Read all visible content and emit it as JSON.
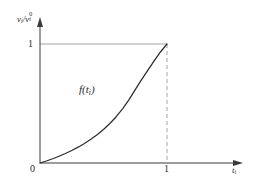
{
  "figure": {
    "background_color": "#ffffff",
    "curve_color": "#2b2b2b",
    "axis_color": "#3a3a3a",
    "guide_color": "#9a9a9a",
    "dashed_color": "#9a9a9a"
  },
  "labels": {
    "y_axis_numerator_var": "v",
    "y_axis_numerator_sub": "i",
    "y_axis_divider": "/",
    "y_axis_denominator_var": "v",
    "y_axis_denominator_sup": "0",
    "y_axis_denominator_sub": "i",
    "x_axis_var": "t",
    "x_axis_sub": "i",
    "function_name": "f",
    "function_open": "(",
    "function_arg_var": "t",
    "function_arg_sub": "i",
    "function_close": ")",
    "y_tick_one": "1",
    "x_tick_one": "1",
    "origin": "0"
  },
  "chart_data": {
    "type": "line",
    "title": "",
    "xlabel": "t_i",
    "ylabel": "v_i / v_i^0",
    "xlim": [
      0,
      1
    ],
    "ylim": [
      0,
      1
    ],
    "grid": false,
    "legend_position": "none",
    "x_ticks": [
      0,
      1
    ],
    "x_tick_labels": [
      "0",
      "1"
    ],
    "y_ticks": [
      0,
      1
    ],
    "y_tick_labels": [
      "0",
      "1"
    ],
    "annotations": [
      {
        "text": "f(t_i)",
        "x": 0.33,
        "y": 0.62
      }
    ],
    "reference_lines": [
      {
        "orientation": "horizontal",
        "value": 1,
        "style": "solid",
        "color": "#9a9a9a",
        "from": 0,
        "to": 1
      },
      {
        "orientation": "vertical",
        "value": 1,
        "style": "dashed",
        "color": "#9a9a9a",
        "from": 0,
        "to": 1
      }
    ],
    "series": [
      {
        "name": "f(t_i)",
        "description": "convex monotonically increasing curve from (0,0) to (1,1)",
        "x": [
          0.0,
          0.05,
          0.1,
          0.15,
          0.2,
          0.25,
          0.3,
          0.35,
          0.4,
          0.45,
          0.5,
          0.55,
          0.6,
          0.65,
          0.7,
          0.75,
          0.8,
          0.85,
          0.9,
          0.95,
          1.0
        ],
        "y": [
          0.0,
          0.017,
          0.036,
          0.057,
          0.08,
          0.105,
          0.133,
          0.164,
          0.199,
          0.238,
          0.282,
          0.332,
          0.389,
          0.455,
          0.53,
          0.616,
          0.7,
          0.78,
          0.86,
          0.935,
          1.0
        ]
      }
    ]
  }
}
